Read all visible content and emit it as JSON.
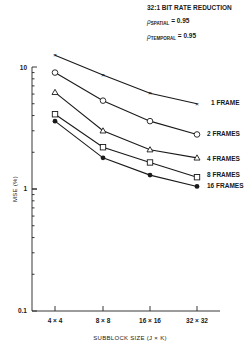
{
  "annotations": {
    "title": "32:1 BIT RATE REDUCTION",
    "rho_spatial_symbol": "ρ",
    "rho_spatial_sub": "SPATIAL",
    "rho_spatial_value": " = 0.95",
    "rho_temporal_symbol": "ρ",
    "rho_temporal_sub": "TEMPORAL",
    "rho_temporal_value": " = 0.95"
  },
  "chart_data": {
    "type": "line",
    "title": "32:1 BIT RATE REDUCTION",
    "xlabel": "SUBBLOCK SIZE (J × K)",
    "ylabel": "MSE (%)",
    "yscale": "log",
    "ylim": [
      0.1,
      10
    ],
    "yticks": [
      "0.1",
      "1",
      "10"
    ],
    "categories": [
      "4 × 4",
      "8 × 8",
      "16 × 16",
      "32 × 32"
    ],
    "grid": false,
    "legend_placement": "right-end-of-lines",
    "series": [
      {
        "name": "1 FRAME",
        "marker": "x",
        "values": [
          12.5,
          8.6,
          6.1,
          5.0
        ]
      },
      {
        "name": "2 FRAMES",
        "marker": "circle-open",
        "values": [
          9.0,
          5.3,
          3.6,
          2.8
        ]
      },
      {
        "name": "4 FRAMES",
        "marker": "triangle-open",
        "values": [
          6.2,
          3.0,
          2.1,
          1.8
        ]
      },
      {
        "name": "8 FRAMES",
        "marker": "square-open",
        "values": [
          4.1,
          2.2,
          1.65,
          1.25
        ]
      },
      {
        "name": "16 FRAMES",
        "marker": "circle-filled",
        "values": [
          3.6,
          1.8,
          1.3,
          1.05
        ]
      }
    ]
  }
}
